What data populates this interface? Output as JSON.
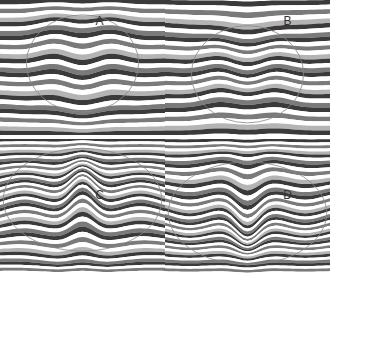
{
  "figure": {
    "panels": [
      {
        "id": "A",
        "label": "A",
        "x": 17,
        "y": 32,
        "w": 165,
        "h": 135,
        "label_y": 14,
        "mode": "dome-up-top"
      },
      {
        "id": "B",
        "label": "B",
        "x": 205,
        "y": 32,
        "w": 165,
        "h": 135,
        "label_y": 14,
        "mode": "dome-down-bottom"
      },
      {
        "id": "C",
        "label": "C",
        "x": 17,
        "y": 206,
        "w": 165,
        "h": 135,
        "label_y": 188,
        "mode": "peak-up"
      },
      {
        "id": "D",
        "label": "D",
        "x": 205,
        "y": 206,
        "w": 165,
        "h": 135,
        "label_y": 188,
        "mode": "trough-down"
      }
    ],
    "colors": {
      "dark": "#3a3a3a",
      "mid": "#7a7a7a",
      "light": "#b4b4b4",
      "white": "#ffffff",
      "outline": "#888888"
    }
  }
}
